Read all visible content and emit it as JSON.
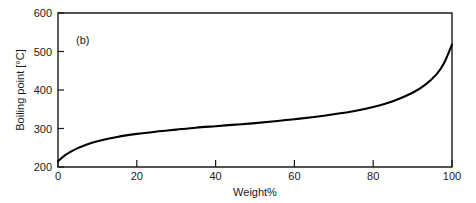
{
  "figure": {
    "panel_label": "(b)",
    "background_color": "#ffffff",
    "curve_color": "#000000",
    "axis_color": "#1a1a1a"
  },
  "chart_data": {
    "type": "line",
    "title": "",
    "subtitle": "",
    "panel_label": "(b)",
    "xlabel": "Weight%",
    "ylabel": "Boiling point [°C]",
    "xlim": [
      0,
      100
    ],
    "ylim": [
      200,
      600
    ],
    "xticks": [
      0,
      20,
      40,
      60,
      80,
      100
    ],
    "xtick_labels": [
      "0",
      "20",
      "40",
      "60",
      "80",
      "100"
    ],
    "yticks": [
      200,
      300,
      400,
      500,
      600
    ],
    "ytick_labels": [
      "200",
      "300",
      "400",
      "500",
      "600"
    ],
    "grid": false,
    "legend": null,
    "legend_position": "none",
    "tick_direction": "in",
    "series": [
      {
        "name": "Boiling point",
        "color": "#000000",
        "x": [
          0,
          2,
          5,
          8,
          10,
          15,
          20,
          25,
          30,
          35,
          40,
          45,
          50,
          55,
          60,
          65,
          70,
          75,
          80,
          85,
          90,
          93,
          96,
          98,
          100
        ],
        "values": [
          215,
          232,
          249,
          261,
          267,
          278,
          286,
          292,
          297,
          302,
          306,
          310,
          314,
          319,
          324,
          330,
          337,
          345,
          356,
          371,
          393,
          412,
          440,
          470,
          518
        ]
      }
    ]
  }
}
